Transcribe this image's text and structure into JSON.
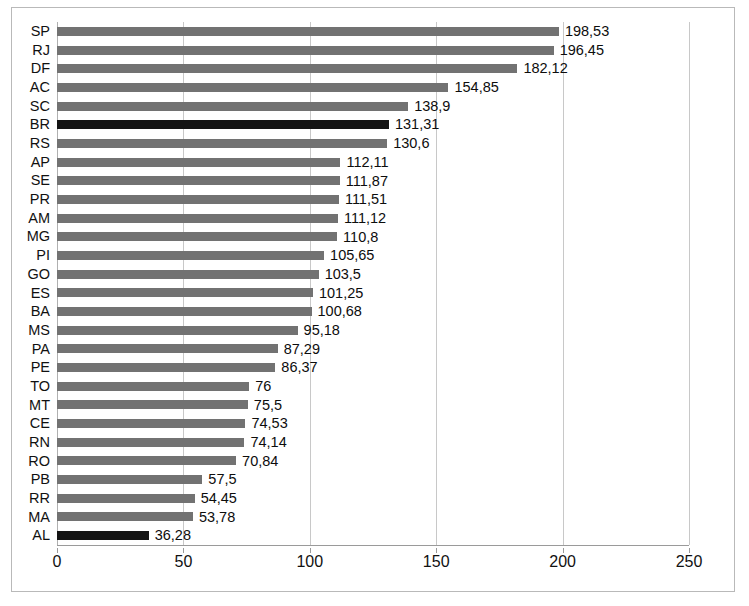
{
  "chart_data": {
    "type": "bar",
    "orientation": "horizontal",
    "title": "",
    "subtitle": "",
    "xlabel": "",
    "ylabel": "",
    "xlim": [
      0,
      250
    ],
    "ylim": null,
    "grid": true,
    "gridlines_x": [
      0,
      50,
      100,
      150,
      200,
      250
    ],
    "legend": null,
    "legend_position": "none",
    "xticks": [
      "0",
      "50",
      "100",
      "150",
      "200",
      "250"
    ],
    "xtick_values": [
      0,
      50,
      100,
      150,
      200,
      250
    ],
    "categories": [
      "SP",
      "RJ",
      "DF",
      "AC",
      "SC",
      "BR",
      "RS",
      "AP",
      "SE",
      "PR",
      "AM",
      "MG",
      "PI",
      "GO",
      "ES",
      "BA",
      "MS",
      "PA",
      "PE",
      "TO",
      "MT",
      "CE",
      "RN",
      "RO",
      "PB",
      "RR",
      "MA",
      "AL"
    ],
    "values": [
      198.53,
      196.45,
      182.12,
      154.85,
      138.9,
      131.31,
      130.6,
      112.11,
      111.87,
      111.51,
      111.12,
      110.8,
      105.65,
      103.5,
      101.25,
      100.68,
      95.18,
      87.29,
      86.37,
      76,
      75.5,
      74.53,
      74.14,
      70.84,
      57.5,
      54.45,
      53.78,
      36.28
    ],
    "value_labels": [
      "198,53",
      "196,45",
      "182,12",
      "154,85",
      "138,9",
      "131,31",
      "130,6",
      "112,11",
      "111,87",
      "111,51",
      "111,12",
      "110,8",
      "105,65",
      "103,5",
      "101,25",
      "100,68",
      "95,18",
      "87,29",
      "86,37",
      "76",
      "75,5",
      "74,53",
      "74,14",
      "70,84",
      "57,5",
      "54,45",
      "53,78",
      "36,28"
    ],
    "highlighted_categories": [
      "BR",
      "AL"
    ],
    "colors": {
      "bar": "#727272",
      "bar_highlight": "#141414",
      "gridline": "#c8c8c8",
      "axis": "#9a9a9a",
      "border": "#b9b9b9",
      "background": "#ffffff",
      "text": "#111111"
    }
  }
}
